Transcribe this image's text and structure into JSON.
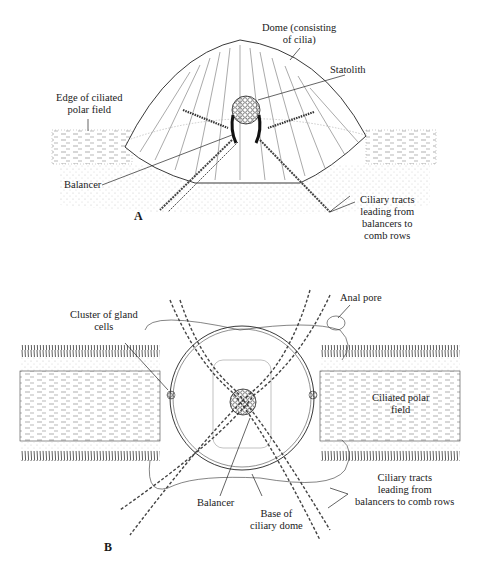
{
  "figure": {
    "panel_a": {
      "letter": "A",
      "labels": {
        "dome": [
          "Dome (consisting",
          "of cilia)"
        ],
        "statolith": "Statolith",
        "edge": [
          "Edge of ciliated",
          "polar field"
        ],
        "balancer": "Balancer",
        "tracts": [
          "Ciliary tracts",
          "leading from",
          "balancers to",
          "comb rows"
        ]
      }
    },
    "panel_b": {
      "letter": "B",
      "labels": {
        "gland": [
          "Cluster of gland",
          "cells"
        ],
        "anal_pore": "Anal pore",
        "polar_field": [
          "Ciliated polar",
          "field"
        ],
        "balancer": "Balancer",
        "base": [
          "Base of",
          "ciliary dome"
        ],
        "tracts": [
          "Ciliary tracts",
          "leading from",
          "balancers to comb rows"
        ]
      }
    },
    "colors": {
      "ink": "#1a1a1a",
      "faint": "#9a9a9a",
      "background": "#ffffff"
    }
  }
}
